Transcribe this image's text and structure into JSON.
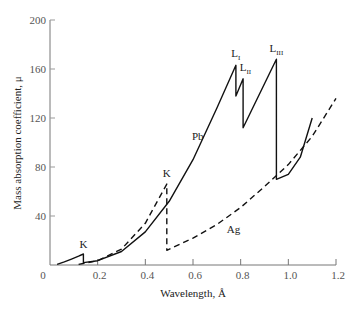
{
  "chart_data": {
    "type": "line",
    "title": "",
    "xlabel": "Wavelength, Å",
    "ylabel": "Mass absorption coefficient, μ",
    "xlim": [
      0,
      1.2
    ],
    "ylim": [
      0,
      200
    ],
    "xticks": [
      0,
      0.2,
      0.4,
      0.6,
      0.8,
      1.0,
      1.2
    ],
    "xtick_labels": [
      "0",
      "0.2",
      "0.4",
      "0.6",
      "0.8",
      "1.0",
      "1.2"
    ],
    "yticks": [
      0,
      40,
      80,
      120,
      160,
      200
    ],
    "ytick_labels": [
      "",
      "40",
      "80",
      "120",
      "160",
      "200"
    ],
    "grid": false,
    "legend": null,
    "series": [
      {
        "name": "Pb",
        "style": "solid",
        "color": "#111111",
        "points": [
          [
            0.03,
            0.5
          ],
          [
            0.06,
            2.5
          ],
          [
            0.09,
            4.8
          ],
          [
            0.12,
            7.2
          ],
          [
            0.14,
            9.0
          ],
          [
            0.14,
            2.0
          ],
          [
            0.2,
            3.5
          ],
          [
            0.3,
            11
          ],
          [
            0.4,
            27
          ],
          [
            0.5,
            52
          ],
          [
            0.6,
            86
          ],
          [
            0.7,
            128
          ],
          [
            0.78,
            163
          ],
          [
            0.78,
            138
          ],
          [
            0.81,
            152
          ],
          [
            0.81,
            112
          ],
          [
            0.95,
            168
          ],
          [
            0.95,
            70
          ],
          [
            1.0,
            74
          ],
          [
            1.05,
            88
          ],
          [
            1.1,
            120
          ]
        ],
        "edges": [
          {
            "label": "K",
            "wavelength": 0.14
          },
          {
            "label": "L_I",
            "wavelength": 0.78
          },
          {
            "label": "L_II",
            "wavelength": 0.81
          },
          {
            "label": "L_III",
            "wavelength": 0.95
          }
        ]
      },
      {
        "name": "Ag",
        "style": "dashed",
        "color": "#111111",
        "points": [
          [
            0.12,
            0.5
          ],
          [
            0.2,
            3.5
          ],
          [
            0.3,
            13
          ],
          [
            0.4,
            34
          ],
          [
            0.49,
            66
          ],
          [
            0.49,
            12
          ],
          [
            0.6,
            22
          ],
          [
            0.7,
            33
          ],
          [
            0.8,
            47
          ],
          [
            0.9,
            64
          ],
          [
            1.0,
            82
          ],
          [
            1.1,
            105
          ],
          [
            1.2,
            136
          ]
        ],
        "edges": [
          {
            "label": "K",
            "wavelength": 0.49
          }
        ]
      }
    ],
    "annotations": [
      {
        "text": "K",
        "x": 0.14,
        "y": 14
      },
      {
        "text": "K",
        "x": 0.49,
        "y": 72
      },
      {
        "text": "Pb",
        "x": 0.62,
        "y": 102
      },
      {
        "text": "Ag",
        "x": 0.77,
        "y": 26
      },
      {
        "text": "L",
        "sub": "I",
        "x": 0.78,
        "y": 170
      },
      {
        "text": "L",
        "sub": "II",
        "x": 0.82,
        "y": 158
      },
      {
        "text": "L",
        "sub": "III",
        "x": 0.95,
        "y": 174
      }
    ]
  }
}
